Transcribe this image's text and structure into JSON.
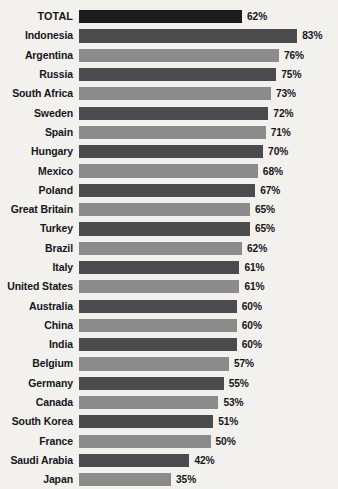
{
  "chart_data": {
    "type": "bar",
    "orientation": "horizontal",
    "title": "",
    "subtitle": "",
    "xlabel": "",
    "ylabel": "",
    "xlim": [
      0,
      100
    ],
    "grid": false,
    "legend": false,
    "value_suffix": "%",
    "categories": [
      "TOTAL",
      "Indonesia",
      "Argentina",
      "Russia",
      "South Africa",
      "Sweden",
      "Spain",
      "Hungary",
      "Mexico",
      "Poland",
      "Great Britain",
      "Turkey",
      "Brazil",
      "Italy",
      "United States",
      "Australia",
      "China",
      "India",
      "Belgium",
      "Germany",
      "Canada",
      "South Korea",
      "France",
      "Saudi Arabia",
      "Japan"
    ],
    "values": [
      62,
      83,
      76,
      75,
      73,
      72,
      71,
      70,
      68,
      67,
      65,
      65,
      62,
      61,
      61,
      60,
      60,
      60,
      57,
      55,
      53,
      51,
      50,
      42,
      35
    ],
    "value_labels": [
      "62%",
      "83%",
      "76%",
      "75%",
      "73%",
      "72%",
      "71%",
      "70%",
      "68%",
      "67%",
      "65%",
      "65%",
      "62%",
      "61%",
      "61%",
      "60%",
      "60%",
      "60%",
      "57%",
      "55%",
      "53%",
      "51%",
      "50%",
      "42%",
      "35%"
    ],
    "bar_tones": [
      "total",
      "dark",
      "light",
      "dark",
      "light",
      "dark",
      "light",
      "dark",
      "light",
      "dark",
      "light",
      "dark",
      "light",
      "dark",
      "light",
      "dark",
      "light",
      "dark",
      "light",
      "dark",
      "light",
      "dark",
      "light",
      "dark",
      "light"
    ],
    "colors": {
      "total": "#1c1c1e",
      "dark": "#4b4b4d",
      "light": "#8b8b8b",
      "background": "#f2f1ee",
      "text": "#16161a"
    }
  },
  "footer": {
    "source_note": ""
  }
}
